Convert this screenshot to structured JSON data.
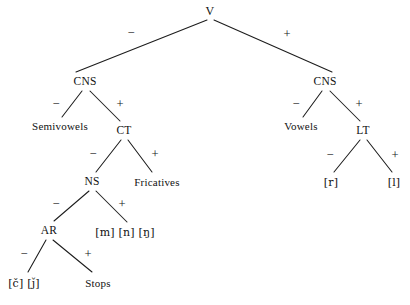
{
  "diagram": {
    "type": "binary-feature-tree",
    "ink_color": "#1c1c1c",
    "background_color": "#ffffff",
    "width": 410,
    "height": 305,
    "nodes": [
      {
        "id": "root",
        "label": "V",
        "x": 210,
        "y": 11,
        "kind": "root"
      },
      {
        "id": "cns_left",
        "label": "CNS",
        "x": 85,
        "y": 82,
        "kind": "internal"
      },
      {
        "id": "cns_right",
        "label": "CNS",
        "x": 325,
        "y": 82,
        "kind": "internal"
      },
      {
        "id": "semivowels",
        "label": "Semivowels",
        "x": 60,
        "y": 126,
        "kind": "terminal"
      },
      {
        "id": "ct",
        "label": "CT",
        "x": 124,
        "y": 131,
        "kind": "internal"
      },
      {
        "id": "vowels",
        "label": "Vowels",
        "x": 301,
        "y": 126,
        "kind": "terminal"
      },
      {
        "id": "lt",
        "label": "LT",
        "x": 363,
        "y": 131,
        "kind": "internal"
      },
      {
        "id": "ns",
        "label": "NS",
        "x": 92,
        "y": 182,
        "kind": "internal"
      },
      {
        "id": "fricatives",
        "label": "Fricatives",
        "x": 157,
        "y": 182,
        "kind": "terminal"
      },
      {
        "id": "r",
        "label": "[r]",
        "x": 331,
        "y": 182,
        "kind": "terminal"
      },
      {
        "id": "l",
        "label": "[l]",
        "x": 394,
        "y": 182,
        "kind": "terminal"
      },
      {
        "id": "ar",
        "label": "AR",
        "x": 49,
        "y": 231,
        "kind": "internal"
      },
      {
        "id": "nasals",
        "label": "[m] [n] [ŋ]",
        "x": 125,
        "y": 232,
        "kind": "terminal"
      },
      {
        "id": "affricates",
        "label": "[č] [ǰ]",
        "x": 24,
        "y": 283,
        "kind": "terminal"
      },
      {
        "id": "stops",
        "label": "Stops",
        "x": 98,
        "y": 283,
        "kind": "terminal"
      }
    ],
    "edges": [
      {
        "id": "e-root-cnsleft",
        "from": "root",
        "to": "cns_left",
        "x1": 207,
        "y1": 20,
        "x2": 76,
        "y2": 72,
        "sign": "−",
        "sign_x": 131,
        "sign_y": 33
      },
      {
        "id": "e-root-cnsright",
        "from": "root",
        "to": "cns_right",
        "x1": 214,
        "y1": 20,
        "x2": 332,
        "y2": 72,
        "sign": "+",
        "sign_x": 287,
        "sign_y": 34
      },
      {
        "id": "e-cnsleft-semi",
        "from": "cns_left",
        "to": "semivowels",
        "x1": 82,
        "y1": 91,
        "x2": 62,
        "y2": 117,
        "sign": "−",
        "sign_x": 56,
        "sign_y": 104
      },
      {
        "id": "e-cnsleft-ct",
        "from": "cns_left",
        "to": "ct",
        "x1": 90,
        "y1": 91,
        "x2": 120,
        "y2": 121,
        "sign": "+",
        "sign_x": 120,
        "sign_y": 104
      },
      {
        "id": "e-cnsright-vow",
        "from": "cns_right",
        "to": "vowels",
        "x1": 322,
        "y1": 91,
        "x2": 303,
        "y2": 117,
        "sign": "−",
        "sign_x": 296,
        "sign_y": 104
      },
      {
        "id": "e-cnsright-lt",
        "from": "cns_right",
        "to": "lt",
        "x1": 330,
        "y1": 91,
        "x2": 360,
        "y2": 121,
        "sign": "+",
        "sign_x": 359,
        "sign_y": 104
      },
      {
        "id": "e-ct-ns",
        "from": "ct",
        "to": "ns",
        "x1": 121,
        "y1": 140,
        "x2": 96,
        "y2": 172,
        "sign": "−",
        "sign_x": 93,
        "sign_y": 154
      },
      {
        "id": "e-ct-fric",
        "from": "ct",
        "to": "fricatives",
        "x1": 128,
        "y1": 140,
        "x2": 152,
        "y2": 172,
        "sign": "+",
        "sign_x": 155,
        "sign_y": 154
      },
      {
        "id": "e-lt-r",
        "from": "lt",
        "to": "r",
        "x1": 360,
        "y1": 140,
        "x2": 334,
        "y2": 172,
        "sign": "−",
        "sign_x": 330,
        "sign_y": 155
      },
      {
        "id": "e-lt-l",
        "from": "lt",
        "to": "l",
        "x1": 367,
        "y1": 140,
        "x2": 392,
        "y2": 172,
        "sign": "+",
        "sign_x": 395,
        "sign_y": 155
      },
      {
        "id": "e-ns-ar",
        "from": "ns",
        "to": "ar",
        "x1": 89,
        "y1": 191,
        "x2": 54,
        "y2": 221,
        "sign": "−",
        "sign_x": 56,
        "sign_y": 204
      },
      {
        "id": "e-ns-nasals",
        "from": "ns",
        "to": "nasals",
        "x1": 96,
        "y1": 191,
        "x2": 127,
        "y2": 222,
        "sign": "+",
        "sign_x": 122,
        "sign_y": 204
      },
      {
        "id": "e-ar-affric",
        "from": "ar",
        "to": "affricates",
        "x1": 46,
        "y1": 240,
        "x2": 28,
        "y2": 272,
        "sign": "−",
        "sign_x": 24,
        "sign_y": 254
      },
      {
        "id": "e-ar-stops",
        "from": "ar",
        "to": "stops",
        "x1": 53,
        "y1": 240,
        "x2": 92,
        "y2": 272,
        "sign": "+",
        "sign_x": 88,
        "sign_y": 254
      }
    ]
  }
}
